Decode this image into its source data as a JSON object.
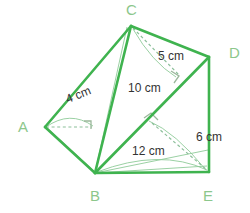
{
  "figure": {
    "colors": {
      "edge_green": "#3fb34f",
      "inner_green": "#7fc98a",
      "vertex_label": "#8cc78c",
      "measure_text": "#333333",
      "dashed_line": "#8cbf9a",
      "background": "#ffffff"
    },
    "vertices": [
      {
        "name": "C",
        "label": "C",
        "x": 131,
        "y": 25,
        "label_x": 126,
        "label_y": 2
      },
      {
        "name": "D",
        "label": "D",
        "x": 209,
        "y": 57,
        "label_x": 229,
        "label_y": 45
      },
      {
        "name": "A",
        "label": "A",
        "x": 45,
        "y": 127,
        "label_x": 18,
        "label_y": 119
      },
      {
        "name": "B",
        "label": "B",
        "x": 95,
        "y": 173,
        "label_x": 90,
        "label_y": 188
      },
      {
        "name": "E",
        "label": "E",
        "x": 209,
        "y": 172,
        "label_x": 203,
        "label_y": 188
      }
    ],
    "measurements": [
      {
        "name": "edge-ab-length",
        "text": "4 cm",
        "x": 64,
        "y": 94,
        "rotate": -22
      },
      {
        "name": "edge-cd-length",
        "text": "5 cm",
        "x": 158,
        "y": 50,
        "rotate": 0
      },
      {
        "name": "edge-cb-length",
        "text": "10 cm",
        "x": 128,
        "y": 82,
        "rotate": 0
      },
      {
        "name": "edge-de-length",
        "text": "6 cm",
        "x": 196,
        "y": 131,
        "rotate": 0
      },
      {
        "name": "edge-be-length",
        "text": "12 cm",
        "x": 132,
        "y": 145,
        "rotate": 0
      }
    ],
    "solid_edges": [
      {
        "name": "edge-A-C",
        "from": "A",
        "to": "C"
      },
      {
        "name": "edge-C-D",
        "from": "C",
        "to": "D"
      },
      {
        "name": "edge-A-B",
        "from": "A",
        "to": "B"
      },
      {
        "name": "edge-C-B",
        "from": "C",
        "to": "B"
      },
      {
        "name": "edge-B-D",
        "from": "B",
        "to": "D"
      },
      {
        "name": "edge-D-E",
        "from": "D",
        "to": "E"
      },
      {
        "name": "edge-B-E",
        "from": "B",
        "to": "E"
      }
    ],
    "hidden_edges": [
      {
        "name": "hidden-edge-A-midline",
        "from": "A",
        "to": "interior"
      },
      {
        "name": "hidden-edge-C-D-interior",
        "from": "C",
        "to": "interior"
      },
      {
        "name": "hidden-edge-B-E-interior",
        "from": "B",
        "to": "interior"
      }
    ],
    "right_angle_marks": [
      {
        "name": "right-angle-at-A-foot",
        "x": 90,
        "y": 127
      },
      {
        "name": "right-angle-at-CD-foot",
        "x": 177,
        "y": 74
      },
      {
        "name": "right-angle-at-BD-foot",
        "x": 150,
        "y": 120
      }
    ]
  }
}
